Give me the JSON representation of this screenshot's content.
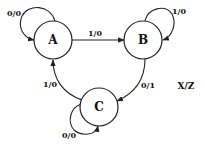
{
  "diagram": {
    "type": "state-machine",
    "legend": "X/Z",
    "states": [
      {
        "id": "A",
        "label": "A"
      },
      {
        "id": "B",
        "label": "B"
      },
      {
        "id": "C",
        "label": "C"
      }
    ],
    "transitions": [
      {
        "from": "A",
        "to": "A",
        "label": "0/0"
      },
      {
        "from": "A",
        "to": "B",
        "label": "1/0"
      },
      {
        "from": "B",
        "to": "B",
        "label": "1/0"
      },
      {
        "from": "B",
        "to": "C",
        "label": "0/1"
      },
      {
        "from": "C",
        "to": "A",
        "label": "1/0"
      },
      {
        "from": "C",
        "to": "C",
        "label": "0/0"
      }
    ]
  }
}
